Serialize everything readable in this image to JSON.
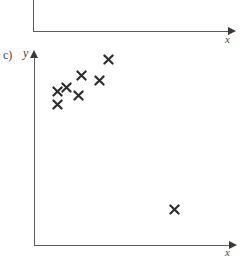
{
  "page": {
    "width": 247,
    "height": 258,
    "background": "#ffffff",
    "ink_color": "#2b2b2b",
    "axis_color": "#5a5a5a"
  },
  "top_chart": {
    "description": "bottom portion of the preceding (cropped) axes",
    "x_axis_label": "x",
    "y_axis": {
      "x": 33,
      "y_top": 0,
      "y_bottom": 31
    },
    "x_axis": {
      "y": 31,
      "x_left": 33,
      "x_right": 231
    },
    "arrow": {
      "x": 228,
      "y": 27
    },
    "label_pos": {
      "x": 225,
      "y": 34
    }
  },
  "main_chart": {
    "panel_label": "c)",
    "panel_label_pos": {
      "x": 3,
      "y": 49
    },
    "y_axis_label": "y",
    "y_axis_label_pos": {
      "x": 23,
      "y": 47
    },
    "x_axis_label": "x",
    "x_axis_label_pos": {
      "x": 225,
      "y": 247
    },
    "y_axis": {
      "x": 34,
      "y_top": 58,
      "y_bottom": 245
    },
    "x_axis": {
      "y": 245,
      "x_left": 34,
      "x_right": 232
    },
    "x_arrow": {
      "x": 229,
      "y": 241
    },
    "y_arrow": {
      "x": 30,
      "y": 50
    },
    "chart_data": {
      "type": "scatter",
      "title": "c)",
      "xlabel": "x",
      "ylabel": "y",
      "grid": false,
      "legend": null,
      "marker": "x",
      "marker_color": "#2b2b2b",
      "axis_style": "arrow axes, no tick marks, no tick labels",
      "xlim": [
        0,
        1
      ],
      "ylim": [
        0,
        1
      ],
      "n_points": 8,
      "relationship": "positive association among seven clustered points plus one low-y outlier at high x",
      "points_px": [
        {
          "x": 57,
          "y": 104
        },
        {
          "x": 57,
          "y": 91
        },
        {
          "x": 66,
          "y": 87
        },
        {
          "x": 78,
          "y": 95
        },
        {
          "x": 81,
          "y": 75
        },
        {
          "x": 99,
          "y": 80
        },
        {
          "x": 108,
          "y": 59
        },
        {
          "x": 174,
          "y": 209
        }
      ],
      "points_data": [
        {
          "x": 0.12,
          "y": 0.76
        },
        {
          "x": 0.12,
          "y": 0.82
        },
        {
          "x": 0.16,
          "y": 0.85
        },
        {
          "x": 0.22,
          "y": 0.81
        },
        {
          "x": 0.24,
          "y": 0.91
        },
        {
          "x": 0.33,
          "y": 0.88
        },
        {
          "x": 0.37,
          "y": 0.99
        },
        {
          "x": 0.71,
          "y": 0.19
        }
      ]
    }
  }
}
